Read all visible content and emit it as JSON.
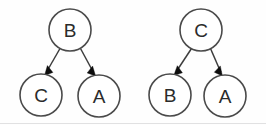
{
  "figure": {
    "title": "",
    "background_color": "#fefefe",
    "node_stroke_color": "#4a4a4a",
    "node_fill_color": "#ffffff",
    "edge_color": "#3d3d3d",
    "arrowhead_color": "#0d0d0d",
    "label_color": "#2b2b2b"
  },
  "trees": [
    {
      "name": "left-tree",
      "nodes": [
        {
          "id": "L-root",
          "label": "B",
          "cx": 70,
          "cy": 30,
          "r": 21
        },
        {
          "id": "L-left",
          "label": "C",
          "cx": 41,
          "cy": 95,
          "r": 21
        },
        {
          "id": "L-right",
          "label": "A",
          "cx": 99,
          "cy": 96,
          "r": 21
        }
      ],
      "edges": [
        {
          "from": "B",
          "to": "C",
          "directed": true
        },
        {
          "from": "B",
          "to": "A",
          "directed": true
        }
      ]
    },
    {
      "name": "right-tree",
      "nodes": [
        {
          "id": "R-root",
          "label": "C",
          "cx": 201,
          "cy": 30,
          "r": 21
        },
        {
          "id": "R-left",
          "label": "B",
          "cx": 170,
          "cy": 95,
          "r": 21
        },
        {
          "id": "R-right",
          "label": "A",
          "cx": 225,
          "cy": 96,
          "r": 21
        }
      ],
      "edges": [
        {
          "from": "C",
          "to": "B",
          "directed": true
        },
        {
          "from": "C",
          "to": "A",
          "directed": true
        }
      ]
    }
  ],
  "labels": {
    "left_root": "B",
    "left_child_left": "C",
    "left_child_right": "A",
    "right_root": "C",
    "right_child_left": "B",
    "right_child_right": "A"
  }
}
